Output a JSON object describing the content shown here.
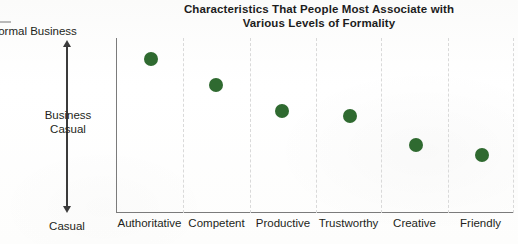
{
  "chart_data": {
    "type": "scatter",
    "title": "Characteristics That People Most Associate with Various Levels of Formality",
    "title_line1": "Characteristics That People Most Associate with",
    "title_line2": "Various Levels of Formality",
    "xlabel": "",
    "ylabel": "",
    "categories": [
      "Authoritative",
      "Competent",
      "Productive",
      "Trustworthy",
      "Creative",
      "Friendly"
    ],
    "y_axis": {
      "type": "ordinal-scale",
      "top_label": "Formal Business",
      "middle_label": "Business Casual",
      "middle_label_line1": "Business",
      "middle_label_line2": "Casual",
      "bottom_label": "Casual",
      "ylim": [
        0,
        100
      ],
      "direction": "bidirectional-arrow"
    },
    "values": [
      88,
      76,
      61,
      58,
      40,
      34
    ],
    "point_color": "#2f6a30",
    "grid": {
      "vertical": true,
      "horizontal": false,
      "style": "dashed",
      "color": "#d9d9d9"
    },
    "legend": null,
    "points": [
      {
        "category": "Authoritative",
        "value": 88,
        "x_px": 151,
        "y_px": 59
      },
      {
        "category": "Competent",
        "value": 76,
        "x_px": 216,
        "y_px": 85
      },
      {
        "category": "Productive",
        "value": 61,
        "x_px": 282,
        "y_px": 111
      },
      {
        "category": "Trustworthy",
        "value": 58,
        "x_px": 350,
        "y_px": 116
      },
      {
        "category": "Creative",
        "value": 40,
        "x_px": 416,
        "y_px": 145
      },
      {
        "category": "Friendly",
        "value": 34,
        "x_px": 482,
        "y_px": 155
      }
    ],
    "gridline_x_px": [
      183,
      250,
      316,
      381,
      448,
      513
    ]
  },
  "colors": {
    "point": "#2f6a30",
    "axis": "#7b7b7b",
    "arrow": "#3b3b3b",
    "gridline": "#d9d9d9",
    "text": "#231f20",
    "background": "#fdfdfc"
  }
}
